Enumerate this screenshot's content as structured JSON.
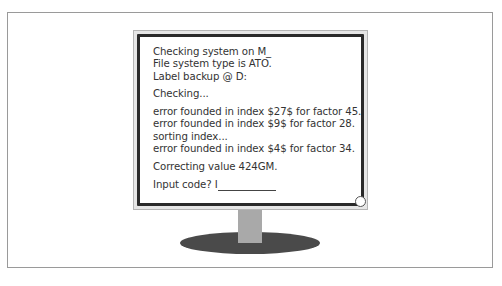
{
  "illustration": {
    "subject": "desktop monitor displaying terminal output",
    "colors": {
      "panel_border": "#9a9a9a",
      "screen_border": "#2a2a2a",
      "text": "#333333",
      "neck": "#a9a9a9",
      "base": "#4a4a4a"
    }
  },
  "terminal": {
    "block1": [
      "Checking system on M_",
      "File system type is ATO.",
      "Label backup @ D:"
    ],
    "block2": [
      "Checking..."
    ],
    "block3": [
      "error founded in index $27$ for factor 45.",
      "error founded in index $9$ for factor 28.",
      "sorting index...",
      "error founded in index $4$ for factor 34."
    ],
    "block4": [
      "Correcting value 424GM."
    ],
    "prompt": "Input code? I"
  }
}
